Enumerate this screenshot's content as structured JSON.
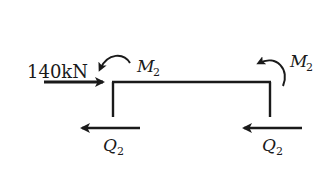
{
  "diagram": {
    "type": "free-body-diagram",
    "colors": {
      "ink": "#1a1a1a",
      "background": "#ffffff"
    },
    "applied_load": {
      "label": "140kN",
      "value": 140,
      "unit": "kN",
      "direction": "right"
    },
    "moments": [
      {
        "id": "left",
        "symbol": "M",
        "subscript": "2",
        "sense": "counterclockwise"
      },
      {
        "id": "right",
        "symbol": "M",
        "subscript": "2",
        "sense": "counterclockwise"
      }
    ],
    "shears": [
      {
        "id": "left",
        "symbol": "Q",
        "subscript": "2",
        "direction": "left"
      },
      {
        "id": "right",
        "symbol": "Q",
        "subscript": "2",
        "direction": "left"
      }
    ],
    "frame": {
      "shape": "inverted-U",
      "members": [
        "left-column",
        "beam",
        "right-column"
      ]
    }
  }
}
